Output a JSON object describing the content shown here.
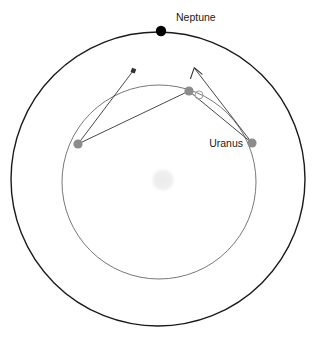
{
  "figure": {
    "type": "orbital-diagram",
    "background_color": "#ffffff",
    "width": 322,
    "height": 343
  },
  "labels": {
    "neptune": "Neptune",
    "uranus": "Uranus"
  },
  "colors": {
    "outer_orbit_stroke": "#1a1a1a",
    "inner_orbit_stroke": "#555555",
    "neptune_body": "#000000",
    "uranus_body": "#8c8c8c",
    "uranus_open_body": "#9a9a9a",
    "sun_body": "#f0f0f0",
    "arrow_stroke": "#333333"
  },
  "chart_data": {
    "type": "scatter",
    "title": "",
    "xlabel": "",
    "ylabel": "",
    "grid": false,
    "legend_position": "none",
    "center": {
      "x": 159,
      "y": 180
    },
    "orbits": [
      {
        "name": "Neptune orbit",
        "cx": 158,
        "cy": 179,
        "r": 147,
        "stroke_width": 1.4,
        "color": "#1a1a1a"
      },
      {
        "name": "Uranus orbit",
        "cx": 159,
        "cy": 182,
        "r": 97,
        "stroke_width": 0.8,
        "color": "#555555"
      }
    ],
    "sun": {
      "cx": 163,
      "cy": 180,
      "r": 13,
      "color": "#f0f0f0"
    },
    "bodies": [
      {
        "name": "Neptune",
        "cx": 161,
        "cy": 31,
        "r": 5.2,
        "color": "#000000",
        "filled": true
      },
      {
        "name": "Uranus-left",
        "cx": 78,
        "cy": 144,
        "r": 4.6,
        "color": "#8c8c8c",
        "filled": true
      },
      {
        "name": "Uranus-top",
        "cx": 189,
        "cy": 91,
        "r": 4.6,
        "color": "#8c8c8c",
        "filled": true
      },
      {
        "name": "Uranus-right",
        "cx": 252,
        "cy": 143,
        "r": 4.6,
        "color": "#8c8c8c",
        "filled": true
      },
      {
        "name": "Uranus-predicted",
        "cx": 199,
        "cy": 95,
        "r": 4.0,
        "color": "#9a9a9a",
        "filled": false
      }
    ],
    "vectors": [
      {
        "name": "left-perturbation-a",
        "x1": 78,
        "y1": 144,
        "x2": 133,
        "y2": 71,
        "head": "square"
      },
      {
        "name": "left-perturbation-b",
        "x1": 78,
        "y1": 144,
        "x2": 189,
        "y2": 91,
        "head": "none"
      },
      {
        "name": "right-perturbation-a",
        "x1": 252,
        "y1": 143,
        "x2": 195,
        "y2": 69,
        "head": "arrow"
      },
      {
        "name": "right-perturbation-b",
        "x1": 252,
        "y1": 143,
        "x2": 190,
        "y2": 92,
        "head": "none"
      }
    ],
    "label_positions": [
      {
        "text": "Neptune",
        "x": 176,
        "y": 21,
        "anchor": "start"
      },
      {
        "text": "Uranus",
        "x": 243,
        "y": 147,
        "anchor": "end"
      }
    ]
  }
}
